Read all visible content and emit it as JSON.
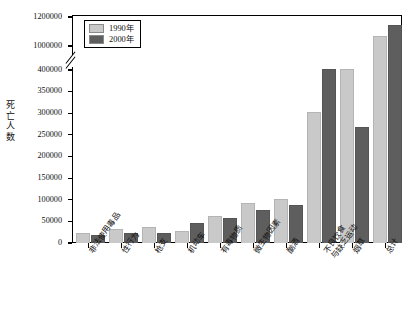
{
  "chart_data": {
    "type": "bar",
    "title": "",
    "subtitle": "",
    "xlabel": "",
    "ylabel": "死亡人数",
    "legend_position": "top-left",
    "grid": false,
    "axis_break": {
      "present": true,
      "lower_max": 400000,
      "upper_min": 1000000
    },
    "yticks": [
      0,
      50000,
      100000,
      150000,
      200000,
      250000,
      300000,
      350000,
      400000,
      1000000,
      1200000
    ],
    "ytick_labels": [
      "0",
      "50000",
      "100000",
      "150000",
      "200000",
      "250000",
      "300000",
      "350000",
      "400000",
      "1000000",
      "1200000"
    ],
    "ylim": [
      0,
      1200000
    ],
    "categories": [
      "非法使用毒品",
      "性行为",
      "枪支",
      "机动车",
      "有毒物质",
      "微生物因素",
      "酗酒",
      "不良饮食与缺乏运动",
      "烟草",
      "总计"
    ],
    "category_lines": [
      [
        "非法使用毒品"
      ],
      [
        "性行为"
      ],
      [
        "枪支"
      ],
      [
        "机动车"
      ],
      [
        "有毒物质"
      ],
      [
        "微生物因素"
      ],
      [
        "酗酒"
      ],
      [
        "不良饮食",
        "与缺乏运动"
      ],
      [
        "烟草"
      ],
      [
        "总计"
      ]
    ],
    "series": [
      {
        "name": "1990年",
        "color": "#c9c9c9",
        "values": [
          20000,
          30000,
          35000,
          25000,
          60000,
          90000,
          100000,
          300000,
          400000,
          1060000
        ]
      },
      {
        "name": "2000年",
        "color": "#5e5e5e",
        "values": [
          17000,
          20000,
          22000,
          43000,
          55000,
          75000,
          85000,
          400000,
          435000,
          1140000
        ]
      }
    ]
  },
  "legend": {
    "items": [
      {
        "label": "1990年",
        "color": "#c9c9c9"
      },
      {
        "label": "2000年",
        "color": "#5e5e5e"
      }
    ]
  },
  "axis": {
    "y_title_chars": [
      "死",
      "亡",
      "人",
      "数"
    ]
  }
}
